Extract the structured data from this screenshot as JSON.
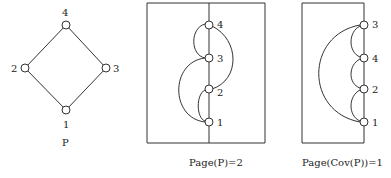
{
  "figure": {
    "poset": {
      "label": "P",
      "nodes": [
        {
          "id": "1",
          "label": "1"
        },
        {
          "id": "2",
          "label": "2"
        },
        {
          "id": "3",
          "label": "3"
        },
        {
          "id": "4",
          "label": "4"
        }
      ],
      "edges": [
        [
          "1",
          "2"
        ],
        [
          "1",
          "3"
        ],
        [
          "2",
          "4"
        ],
        [
          "3",
          "4"
        ]
      ]
    },
    "book_embedding_P": {
      "caption": "Page(P)=2",
      "spine_order": [
        "1",
        "2",
        "3",
        "4"
      ],
      "labels": {
        "n1": "1",
        "n2": "2",
        "n3": "3",
        "n4": "4"
      }
    },
    "book_embedding_cov": {
      "caption": "Page(Cov(P))=1",
      "spine_order": [
        "1",
        "2",
        "4",
        "3"
      ],
      "labels": {
        "n1": "1",
        "n2": "2",
        "n4": "4",
        "n3": "3"
      }
    }
  }
}
